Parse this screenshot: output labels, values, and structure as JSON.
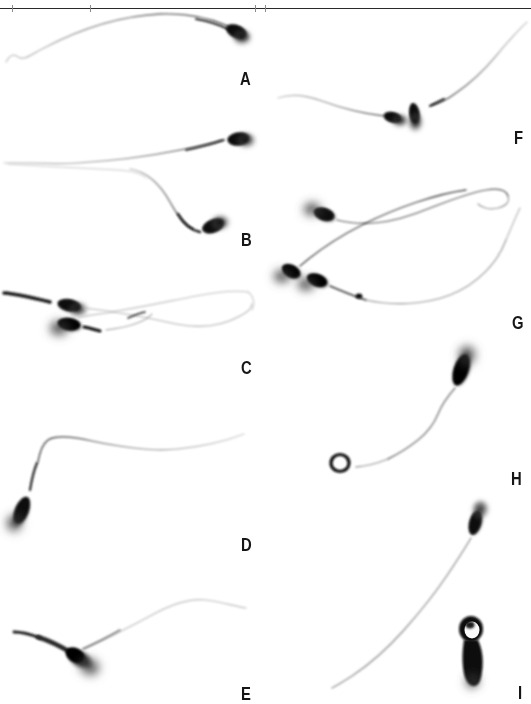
{
  "figure": {
    "width": 531,
    "height": 704,
    "background_color": "#ffffff",
    "ink_color": "#111111",
    "type": "light-microscopy-plate",
    "top_rule": {
      "visible": true,
      "color": "#2a2a2a",
      "y": 8,
      "ticks_x": [
        12,
        90,
        255,
        265
      ]
    }
  },
  "panels": [
    {
      "id": "A",
      "label": "A",
      "label_x": 240,
      "label_y": 69,
      "description": "single spermatozoon, head at upper right, long smoothly arched tail sweeping left and down",
      "cell_count": 1,
      "head_count": 1
    },
    {
      "id": "B",
      "label": "B",
      "label_x": 241,
      "label_y": 230,
      "description": "two spermatozoa, upper head at right with tail running left, lower head at right of a descending hooked tail",
      "cell_count": 2,
      "head_count": 2
    },
    {
      "id": "C",
      "label": "C",
      "label_x": 241,
      "label_y": 358,
      "description": "two spermatozoa with heads overlapping at left, tails crossing and extending to the right",
      "cell_count": 2,
      "head_count": 2
    },
    {
      "id": "D",
      "label": "D",
      "label_x": 241,
      "label_y": 535,
      "description": "single spermatozoon, tapered head at lower left, tail bending sharply upward then running right",
      "cell_count": 1,
      "head_count": 1
    },
    {
      "id": "E",
      "label": "E",
      "label_x": 241,
      "label_y": 684,
      "description": "single spermatozoon with broad pear-shaped head at left and a dark proximal spur, tail arcing to upper right",
      "cell_count": 1,
      "head_count": 1
    },
    {
      "id": "F",
      "label": "F",
      "label_x": 514,
      "label_y": 128,
      "description": "two spermatozoa, one head facing right with long left tail, the second head vertical with tail sweeping to upper right",
      "cell_count": 2,
      "head_count": 2
    },
    {
      "id": "G",
      "label": "G",
      "label_x": 512,
      "label_y": 313,
      "description": "cluster of three spermatozoa with heads grouped at the left and long looping tails to the right",
      "cell_count": 3,
      "head_count": 3
    },
    {
      "id": "H",
      "label": "H",
      "label_x": 511,
      "label_y": 469,
      "description": "single spermatozoon with head at upper right and a terminally coiled tail forming a ring at lower left",
      "cell_count": 1,
      "head_count": 1
    },
    {
      "id": "I",
      "label": "I",
      "label_x": 516,
      "label_y": 683,
      "description": "spermatozoon with head at upper right and long tail to lower left, plus an adjacent cell bearing a large cytoplasmic droplet",
      "cell_count": 2,
      "head_count": 2
    }
  ]
}
